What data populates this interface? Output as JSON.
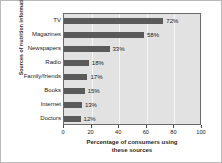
{
  "chart_data": {
    "type": "bar",
    "orientation": "horizontal",
    "title": "",
    "xlabel": "Percentage of consumers using these sources",
    "ylabel": "Sources of nutrition information",
    "categories": [
      "TV",
      "Magazines",
      "Newspapers",
      "Radio",
      "Family/friends",
      "Books",
      "Internet",
      "Doctors"
    ],
    "values": [
      72,
      58,
      33,
      18,
      17,
      15,
      13,
      12
    ],
    "data_labels": [
      "72%",
      "58%",
      "33%",
      "18%",
      "17%",
      "15%",
      "13%",
      "12%"
    ],
    "xlim": [
      0,
      100
    ],
    "xticks": [
      0,
      20,
      40,
      60,
      80,
      100
    ],
    "xticklabels": [
      "0",
      "20",
      "40",
      "60",
      "80",
      "100"
    ],
    "grid": true,
    "legend": false,
    "bar_color": "#5a5a5a",
    "plot_background": "#e2e2e2",
    "gridline_color": "#f6f6f6"
  },
  "axis": {
    "x_title_line1": "Percentage of consumers using",
    "x_title_line2": "these sources",
    "y_title": "Sources of nutrition information"
  }
}
